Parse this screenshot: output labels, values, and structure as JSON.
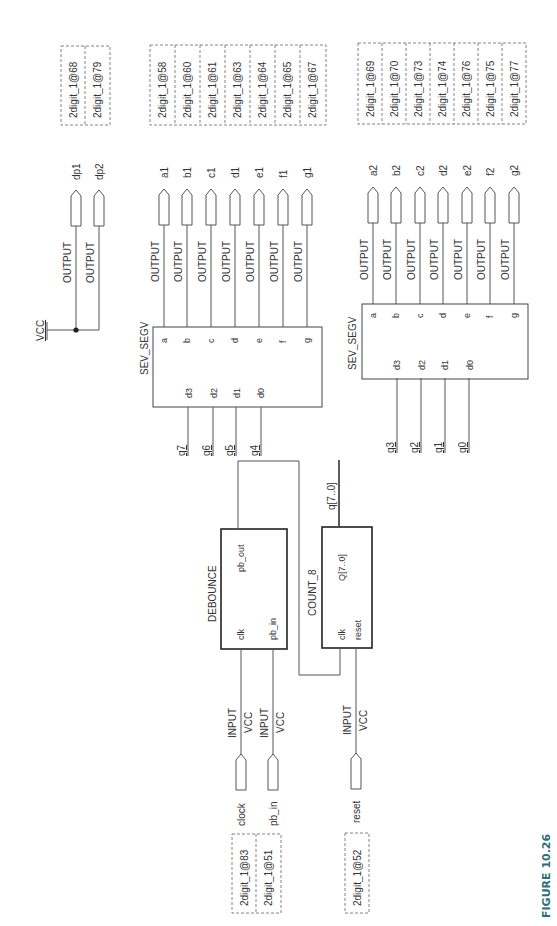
{
  "figure": {
    "label": "FIGURE 10.26",
    "color": "#2e6e78"
  },
  "vcc": {
    "label": "VCC"
  },
  "pin_assignments": {
    "decimal_points": [
      "2digit_1@68",
      "2digit_1@79"
    ],
    "digit1_segments": [
      "2digit_1@58",
      "2digit_1@60",
      "2digit_1@61",
      "2digit_1@63",
      "2digit_1@64",
      "2digit_1@65",
      "2digit_1@67"
    ],
    "digit2_segments": [
      "2digit_1@69",
      "2digit_1@70",
      "2digit_1@73",
      "2digit_1@74",
      "2digit_1@76",
      "2digit_1@75",
      "2digit_1@77"
    ],
    "inputs_clock_pb": [
      "2digit_1@83",
      "2digit_1@51"
    ],
    "input_reset": [
      "2digit_1@52"
    ]
  },
  "outputs": {
    "type_label": "OUTPUT",
    "decimal_points": [
      "dp1",
      "dp2"
    ],
    "digit1": [
      "a1",
      "b1",
      "c1",
      "d1",
      "e1",
      "f1",
      "g1"
    ],
    "digit2": [
      "a2",
      "b2",
      "c2",
      "d2",
      "e2",
      "f2",
      "g2"
    ]
  },
  "sev_segv_1": {
    "name": "SEV_SEGV",
    "out_ports": [
      "a",
      "b",
      "c",
      "d",
      "e",
      "f",
      "g"
    ],
    "in_ports": [
      "d3",
      "d2",
      "d1",
      "d0"
    ],
    "in_nets": [
      "q7",
      "q6",
      "q5",
      "q4"
    ]
  },
  "sev_segv_2": {
    "name": "SEV_SEGV",
    "out_ports": [
      "a",
      "b",
      "c",
      "d",
      "e",
      "f",
      "g"
    ],
    "in_ports": [
      "d3",
      "d2",
      "d1",
      "d0"
    ],
    "in_nets": [
      "q3",
      "q2",
      "q1",
      "q0"
    ]
  },
  "debounce": {
    "name": "DEBOUNCE",
    "ports": {
      "clk": "clk",
      "pb_in": "pb_in",
      "pb_out": "pb_out"
    }
  },
  "count_8": {
    "name": "COUNT_8",
    "ports": {
      "clk": "clk",
      "reset": "reset",
      "q": "Q[7..0]"
    },
    "out_net": "q[7..0]"
  },
  "inputs": {
    "type_label": "INPUT",
    "default_label": "VCC",
    "names": [
      "clock",
      "pb_in",
      "reset"
    ]
  }
}
